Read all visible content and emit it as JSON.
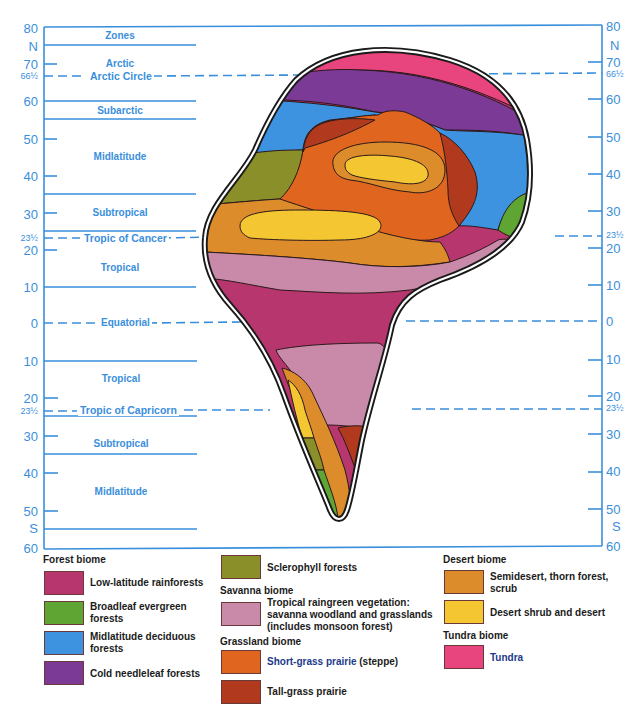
{
  "axes": {
    "color": "#3a8fdc",
    "left_labels": [
      {
        "text": "80",
        "y": 22,
        "small": false
      },
      {
        "text": "N",
        "y": 40,
        "small": false
      },
      {
        "text": "70",
        "y": 58,
        "small": false
      },
      {
        "text": "66½",
        "y": 72,
        "small": true
      },
      {
        "text": "60",
        "y": 95,
        "small": false
      },
      {
        "text": "50",
        "y": 133,
        "small": false
      },
      {
        "text": "40",
        "y": 170,
        "small": false
      },
      {
        "text": "30",
        "y": 208,
        "small": false
      },
      {
        "text": "23½",
        "y": 234,
        "small": true
      },
      {
        "text": "20",
        "y": 244,
        "small": false
      },
      {
        "text": "10",
        "y": 281,
        "small": false
      },
      {
        "text": "0",
        "y": 317,
        "small": false
      },
      {
        "text": "10",
        "y": 355,
        "small": false
      },
      {
        "text": "20",
        "y": 392,
        "small": false
      },
      {
        "text": "23½",
        "y": 407,
        "small": true
      },
      {
        "text": "30",
        "y": 430,
        "small": false
      },
      {
        "text": "40",
        "y": 467,
        "small": false
      },
      {
        "text": "50",
        "y": 505,
        "small": false
      },
      {
        "text": "S",
        "y": 522,
        "small": false
      },
      {
        "text": "60",
        "y": 542,
        "small": false
      }
    ],
    "right_labels": [
      {
        "text": "80",
        "y": 20,
        "small": false
      },
      {
        "text": "N",
        "y": 39,
        "small": false
      },
      {
        "text": "70",
        "y": 56,
        "small": false
      },
      {
        "text": "66½",
        "y": 70,
        "small": true
      },
      {
        "text": "60",
        "y": 93,
        "small": false
      },
      {
        "text": "50",
        "y": 131,
        "small": false
      },
      {
        "text": "40",
        "y": 168,
        "small": false
      },
      {
        "text": "30",
        "y": 205,
        "small": false
      },
      {
        "text": "23½",
        "y": 231,
        "small": true
      },
      {
        "text": "20",
        "y": 242,
        "small": false
      },
      {
        "text": "10",
        "y": 279,
        "small": false
      },
      {
        "text": "0",
        "y": 315,
        "small": false
      },
      {
        "text": "10",
        "y": 353,
        "small": false
      },
      {
        "text": "20",
        "y": 390,
        "small": false
      },
      {
        "text": "23½",
        "y": 404,
        "small": true
      },
      {
        "text": "30",
        "y": 428,
        "small": false
      },
      {
        "text": "40",
        "y": 465,
        "small": false
      },
      {
        "text": "50",
        "y": 503,
        "small": false
      },
      {
        "text": "S",
        "y": 520,
        "small": false
      },
      {
        "text": "60",
        "y": 540,
        "small": false
      }
    ]
  },
  "zones": {
    "header": "Zones",
    "arctic": "Arctic",
    "arctic_circle": "Arctic Circle",
    "subarctic": "Subarctic",
    "midlatitude_n": "Midlatitude",
    "subtropical_n": "Subtropical",
    "tropic_of_cancer": "Tropic of Cancer",
    "tropical_n": "Tropical",
    "equatorial": "Equatorial",
    "tropical_s": "Tropical",
    "tropic_of_capricorn": "Tropic of Capricorn",
    "subtropical_s": "Subtropical",
    "midlatitude_s": "Midlatitude"
  },
  "biome_colors": {
    "low_latitude_rainforest": "#b8366e",
    "broadleaf_evergreen": "#5fa533",
    "midlatitude_deciduous": "#3d93e0",
    "cold_needleleaf": "#7b3a95",
    "sclerophyll": "#8a8f2a",
    "savanna": "#c989a8",
    "short_grass_prairie": "#e0651e",
    "tall_grass_prairie": "#b13a1e",
    "semidesert": "#dd8c2c",
    "desert": "#f4c631",
    "tundra": "#e8457f"
  },
  "legend": {
    "forest_biome": {
      "heading": "Forest biome",
      "items": [
        {
          "label": "Low-latitude rainforests",
          "color": "#b8366e"
        },
        {
          "label": "Broadleaf evergreen forests",
          "line1": "Broadleaf evergreen",
          "line2": "forests",
          "color": "#5fa533"
        },
        {
          "label": "Midlatitude deciduous forests",
          "line1": "Midlatitude deciduous",
          "line2": "forests",
          "color": "#3d93e0"
        },
        {
          "label": "Cold needleleaf forests",
          "color": "#7b3a95"
        }
      ]
    },
    "sclerophyll": {
      "label": "Sclerophyll forests",
      "color": "#8a8f2a"
    },
    "savanna_biome": {
      "heading": "Savanna biome",
      "item": {
        "line1": "Tropical raingreen vegetation:",
        "line2": "savanna woodland and grasslands",
        "line3": "(includes monsoon forest)",
        "color": "#c989a8"
      }
    },
    "grassland_biome": {
      "heading": "Grassland biome",
      "items": [
        {
          "label": "Short-grass prairie",
          "suffix": " (steppe)",
          "color": "#e0651e"
        },
        {
          "label": "Tall-grass prairie",
          "color": "#b13a1e"
        }
      ]
    },
    "desert_biome": {
      "heading": "Desert biome",
      "items": [
        {
          "line1": "Semidesert, thorn forest,",
          "line2": "scrub",
          "color": "#dd8c2c"
        },
        {
          "label": "Desert shrub and desert",
          "color": "#f4c631"
        }
      ]
    },
    "tundra_biome": {
      "heading": "Tundra biome",
      "items": [
        {
          "label": "Tundra",
          "color": "#e8457f"
        }
      ]
    }
  }
}
